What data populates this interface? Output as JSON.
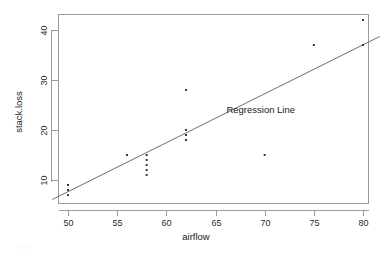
{
  "chart_data": {
    "type": "scatter",
    "title": "",
    "xlabel": "airflow",
    "ylabel": "stack.loss",
    "xlim": [
      48.4,
      81.7
    ],
    "ylim": [
      5.4,
      43.2
    ],
    "xticks": [
      50,
      55,
      60,
      65,
      70,
      75,
      80
    ],
    "xtick_labels": [
      "50",
      "55",
      "60",
      "65",
      "70",
      "75",
      "80"
    ],
    "yticks": [
      10,
      20,
      30,
      40
    ],
    "ytick_labels": [
      "10",
      "20",
      "30",
      "40"
    ],
    "grid": false,
    "legend_position": "none",
    "points": [
      {
        "x": 50,
        "y": 7
      },
      {
        "x": 50,
        "y": 8
      },
      {
        "x": 50,
        "y": 9
      },
      {
        "x": 56,
        "y": 15
      },
      {
        "x": 58,
        "y": 15
      },
      {
        "x": 58,
        "y": 14
      },
      {
        "x": 58,
        "y": 13
      },
      {
        "x": 58,
        "y": 12
      },
      {
        "x": 58,
        "y": 11
      },
      {
        "x": 62,
        "y": 28
      },
      {
        "x": 62,
        "y": 20
      },
      {
        "x": 62,
        "y": 19
      },
      {
        "x": 62,
        "y": 18
      },
      {
        "x": 70,
        "y": 15
      },
      {
        "x": 75,
        "y": 37
      },
      {
        "x": 80,
        "y": 42
      },
      {
        "x": 80,
        "y": 37
      }
    ],
    "series": [
      {
        "name": "Regression Line",
        "type": "line",
        "x": [
          48.4,
          81.7
        ],
        "y": [
          6.1,
          38.7
        ]
      }
    ],
    "annotations": [
      {
        "text": "Regression Line",
        "x": 69.6,
        "y": 23.4
      }
    ]
  },
  "axis": {
    "x_title": "airflow",
    "y_title": "stack.loss"
  },
  "annotation": {
    "regression_label": "Regression Line"
  },
  "colors": {
    "point": "#3a3a3a",
    "line": "#6e6e6e",
    "frame": "#9a9a9a",
    "text": "#1a1a1a",
    "background": "#ffffff"
  }
}
